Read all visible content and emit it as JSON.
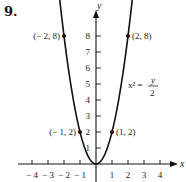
{
  "problem_number": "9.",
  "chart_data": {
    "type": "line",
    "title": "",
    "xlabel": "x",
    "ylabel": "y",
    "xlim": [
      -4.5,
      4.5
    ],
    "ylim": [
      0,
      9
    ],
    "grid": false,
    "x_ticks": [
      -4,
      -3,
      -2,
      -1,
      1,
      2,
      3,
      4
    ],
    "x_tick_labels": [
      "− 4",
      "− 3",
      "− 2",
      "− 1",
      "1",
      "2",
      "3",
      "4"
    ],
    "y_ticks": [
      1,
      2,
      3,
      4,
      5,
      6,
      7,
      8
    ],
    "y_tick_labels": [
      "1",
      "2",
      "3",
      "4",
      "5",
      "6",
      "7",
      "8"
    ],
    "series": [
      {
        "name": "x² = y/2",
        "equation": "y = 2x²",
        "x_range": [
          -2.35,
          2.35
        ],
        "arrows_at_ends": true
      }
    ],
    "points": [
      {
        "x": -2,
        "y": 8,
        "label": "(− 2, 8)"
      },
      {
        "x": 2,
        "y": 8,
        "label": "(2, 8)"
      },
      {
        "x": -1,
        "y": 2,
        "label": "(− 1, 2)"
      },
      {
        "x": 1,
        "y": 2,
        "label": "(1, 2)"
      }
    ],
    "annotation": {
      "lhs": "x² =",
      "numerator": "y",
      "denominator": "2"
    }
  }
}
